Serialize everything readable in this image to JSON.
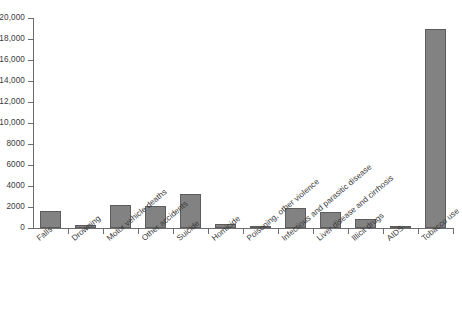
{
  "chart_data": {
    "type": "bar",
    "title": "",
    "subtitle": "",
    "xlabel": "",
    "ylabel": "",
    "ylim": [
      0,
      20000
    ],
    "ytick_step": 2000,
    "grid": false,
    "legend": "none",
    "orientation": "vertical",
    "bar_color": "#828282",
    "bar_edge_color": "#5c5c5c",
    "axis_color": "#6d6d6d",
    "text_color": "#3a3a3a",
    "background_color": "#ffffff",
    "xtick_label_rotation": -40,
    "categories": [
      "Falls",
      "Drowning",
      "Motor vehicle deaths",
      "Other accidents",
      "Suicide",
      "Homicide",
      "Poisoning, other violence",
      "Infectious and parasitic disease",
      "Liver disease and cirrhosis",
      "Illicit drugs",
      "AIDS",
      "Tobacco use"
    ],
    "values": [
      1600,
      300,
      2200,
      2100,
      3200,
      400,
      200,
      1900,
      1500,
      900,
      200,
      19000
    ],
    "ytick_labels": [
      "0",
      "2000",
      "4000",
      "6000",
      "8000",
      "10,000",
      "12,000",
      "14,000",
      "16,000",
      "18,000",
      "20,000"
    ],
    "ytick_values": [
      0,
      2000,
      4000,
      6000,
      8000,
      10000,
      12000,
      14000,
      16000,
      18000,
      20000
    ]
  }
}
